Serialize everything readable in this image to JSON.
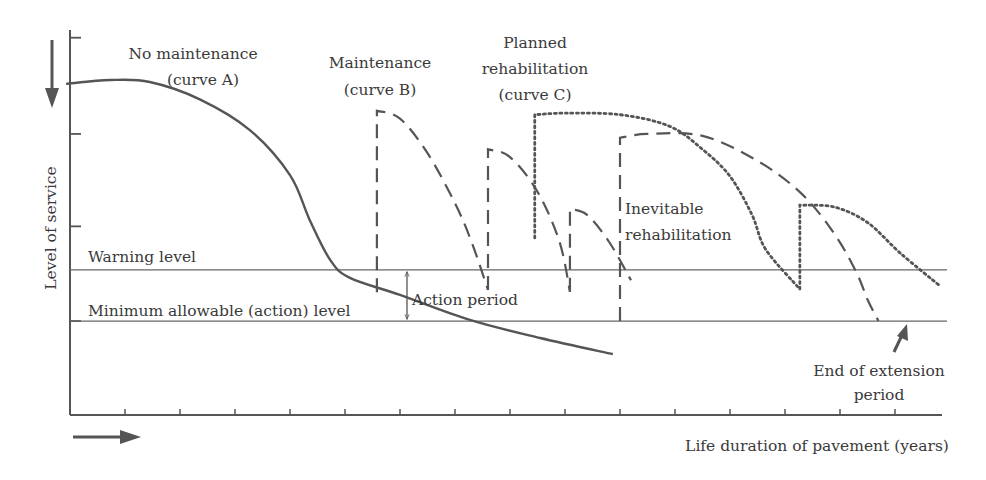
{
  "chart_data": {
    "type": "line",
    "title": "",
    "xlabel": "Life duration of pavement (years)",
    "ylabel": "Level of service",
    "x_direction_arrow": "right",
    "y_direction_arrow": "down",
    "xlim": [
      0,
      16
    ],
    "ylim": [
      0,
      100
    ],
    "x_ticks": [
      1,
      2,
      3,
      4,
      5,
      6,
      7,
      8,
      9,
      10,
      11,
      12,
      13,
      14,
      15
    ],
    "y_ticks": [
      24.4,
      49,
      73,
      98
    ],
    "grid": false,
    "reference_lines": [
      {
        "name": "Warning level",
        "y": 37.7
      },
      {
        "name": "Minimum allowable (action) level",
        "y": 24.4
      }
    ],
    "series": [
      {
        "name": "No maintenance (curve A)",
        "style": "solid",
        "segments": [
          [
            [
              -0.07,
              86
            ],
            [
              0.73,
              87
            ],
            [
              1.45,
              86.5
            ],
            [
              2.36,
              82
            ],
            [
              3.27,
              74
            ],
            [
              4.0,
              62.3
            ],
            [
              4.36,
              50.6
            ],
            [
              4.73,
              40.3
            ],
            [
              5.09,
              35.6
            ],
            [
              6.0,
              31.2
            ],
            [
              7.27,
              24.7
            ],
            [
              8.55,
              20
            ],
            [
              9.87,
              15.8
            ]
          ]
        ]
      },
      {
        "name": "Maintenance (curve B)",
        "style": "dashed",
        "segments": [
          [
            [
              5.58,
              31.9
            ],
            [
              5.58,
              79
            ],
            [
              6.0,
              77
            ],
            [
              6.5,
              68
            ],
            [
              7.0,
              55
            ],
            [
              7.3,
              45
            ],
            [
              7.6,
              32.5
            ]
          ],
          [
            [
              7.6,
              32.5
            ],
            [
              7.6,
              69
            ],
            [
              8.0,
              67
            ],
            [
              8.5,
              58
            ],
            [
              8.9,
              45
            ],
            [
              8.73,
              42
            ],
            [
              9.09,
              32
            ]
          ],
          [
            [
              9.09,
              32
            ],
            [
              9.09,
              53.5
            ],
            [
              9.4,
              52
            ],
            [
              9.8,
              45
            ],
            [
              10.2,
              35
            ],
            [
              10.0,
              24.4
            ]
          ],
          [
            [
              10.0,
              24.4
            ],
            [
              10.0,
              72
            ],
            [
              10.5,
              73
            ],
            [
              11.5,
              72.5
            ],
            [
              12.5,
              66
            ],
            [
              13.3,
              57.5
            ],
            [
              13.9,
              47
            ],
            [
              14.3,
              37
            ],
            [
              14.5,
              30
            ],
            [
              14.7,
              24.4
            ]
          ]
        ]
      },
      {
        "name": "Planned rehabilitation (curve C)",
        "style": "dotted",
        "segments": [
          [
            [
              8.45,
              46
            ],
            [
              8.45,
              78
            ],
            [
              9.0,
              78.4
            ],
            [
              10.0,
              78
            ],
            [
              10.9,
              75
            ],
            [
              11.5,
              69
            ],
            [
              12.0,
              62
            ],
            [
              12.4,
              52
            ],
            [
              12.65,
              43
            ],
            [
              13.27,
              32.7
            ]
          ],
          [
            [
              13.27,
              32.7
            ],
            [
              13.27,
              54.5
            ],
            [
              13.9,
              54
            ],
            [
              14.5,
              50
            ],
            [
              15.1,
              42
            ],
            [
              15.82,
              33.5
            ]
          ]
        ]
      }
    ],
    "annotations": [
      {
        "text": "Action period",
        "x": 6.0,
        "y_range": [
          24.4,
          37.7
        ]
      },
      {
        "text": "Inevitable rehabilitation",
        "x": 10.0
      },
      {
        "text": "End of extension period",
        "x": 14.7,
        "y": 24.4
      }
    ]
  },
  "labels": {
    "curve_a": [
      "No maintenance",
      "(curve A)"
    ],
    "curve_b": [
      "Maintenance",
      "(curve B)"
    ],
    "curve_c": [
      "Planned",
      "rehabilitation",
      "(curve C)"
    ],
    "warning": "Warning level",
    "minimum": "Minimum allowable (action) level",
    "action_period": "Action period",
    "inevitable": [
      "Inevitable",
      "rehabilitation"
    ],
    "end_extension": [
      "End of extension",
      "period"
    ],
    "ylabel": "Level of service",
    "xlabel": "Life duration of pavement (years)"
  }
}
